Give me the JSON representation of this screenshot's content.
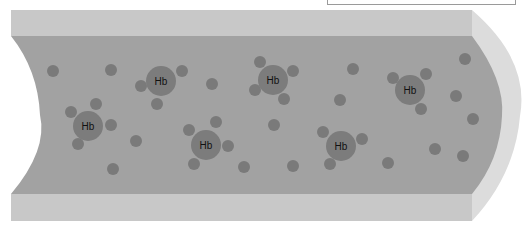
{
  "diagram": {
    "title": "",
    "colors": {
      "background": "#ffffff",
      "wall": "#c8c8c8",
      "wall_end": "#dcdcdc",
      "lumen": "#a2a2a2",
      "molecule": "#7c7c7c",
      "ligand": "#7a7a7a",
      "free_particle": "#7a7a7a",
      "label_box_border": "#9a9a9a"
    },
    "label_box": {
      "text": ""
    },
    "hemoglobin": [
      {
        "label": "Hb",
        "cx": 88,
        "cy": 126,
        "ligands": [
          [
            71,
            112
          ],
          [
            96,
            104
          ],
          [
            111,
            125
          ],
          [
            78,
            144
          ]
        ]
      },
      {
        "label": "Hb",
        "cx": 161,
        "cy": 81,
        "ligands": [
          [
            141,
            86
          ],
          [
            182,
            71
          ],
          [
            157,
            104
          ]
        ]
      },
      {
        "label": "Hb",
        "cx": 273,
        "cy": 80,
        "ligands": [
          [
            260,
            62
          ],
          [
            293,
            71
          ],
          [
            255,
            90
          ],
          [
            284,
            99
          ]
        ]
      },
      {
        "label": "Hb",
        "cx": 206,
        "cy": 145,
        "ligands": [
          [
            189,
            130
          ],
          [
            216,
            122
          ],
          [
            228,
            146
          ],
          [
            194,
            164
          ]
        ]
      },
      {
        "label": "Hb",
        "cx": 341,
        "cy": 146,
        "ligands": [
          [
            323,
            132
          ],
          [
            362,
            139
          ],
          [
            330,
            164
          ]
        ]
      },
      {
        "label": "Hb",
        "cx": 410,
        "cy": 90,
        "ligands": [
          [
            393,
            78
          ],
          [
            426,
            74
          ],
          [
            421,
            109
          ]
        ]
      }
    ],
    "free_particles": [
      [
        53,
        71
      ],
      [
        111,
        70
      ],
      [
        212,
        84
      ],
      [
        353,
        69
      ],
      [
        465,
        59
      ],
      [
        340,
        100
      ],
      [
        456,
        96
      ],
      [
        274,
        125
      ],
      [
        136,
        141
      ],
      [
        473,
        119
      ],
      [
        435,
        149
      ],
      [
        113,
        169
      ],
      [
        244,
        167
      ],
      [
        293,
        166
      ],
      [
        388,
        163
      ],
      [
        463,
        156
      ]
    ]
  }
}
